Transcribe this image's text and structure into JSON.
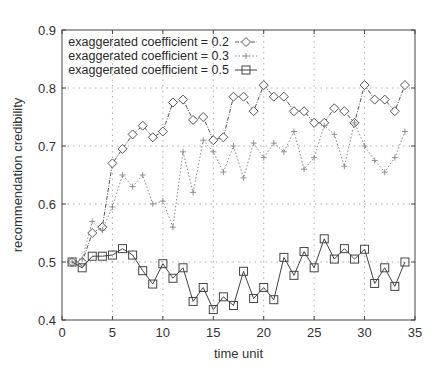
{
  "chart_data": {
    "type": "line",
    "title": "",
    "xlabel": "time unit",
    "ylabel": "recommendation credibility",
    "xlim": [
      0,
      35
    ],
    "ylim": [
      0.4,
      0.9
    ],
    "xticks": [
      0,
      5,
      10,
      15,
      20,
      25,
      30,
      35
    ],
    "yticks": [
      0.4,
      0.5,
      0.6,
      0.7,
      0.8,
      0.9
    ],
    "ytick_labels": [
      "0.4",
      "0.5",
      "0.6",
      "0.7",
      "0.8",
      "0.9"
    ],
    "grid": true,
    "legend_position": "upper left",
    "x": [
      1,
      2,
      3,
      4,
      5,
      6,
      7,
      8,
      9,
      10,
      11,
      12,
      13,
      14,
      15,
      16,
      17,
      18,
      19,
      20,
      21,
      22,
      23,
      24,
      25,
      26,
      27,
      28,
      29,
      30,
      31,
      32,
      33,
      34
    ],
    "series": [
      {
        "name": "exaggerated coefficient = 0.2",
        "marker": "diamond",
        "line": "dash-dot",
        "values": [
          0.5,
          0.5,
          0.55,
          0.56,
          0.67,
          0.695,
          0.72,
          0.735,
          0.715,
          0.725,
          0.775,
          0.78,
          0.745,
          0.75,
          0.71,
          0.715,
          0.785,
          0.785,
          0.76,
          0.805,
          0.785,
          0.785,
          0.76,
          0.76,
          0.74,
          0.74,
          0.765,
          0.76,
          0.74,
          0.805,
          0.78,
          0.78,
          0.76,
          0.805
        ]
      },
      {
        "name": "exaggerated coefficient = 0.3",
        "marker": "plus",
        "line": "dotted",
        "values": [
          0.5,
          0.505,
          0.57,
          0.555,
          0.595,
          0.65,
          0.63,
          0.65,
          0.6,
          0.605,
          0.56,
          0.69,
          0.62,
          0.71,
          0.69,
          0.655,
          0.7,
          0.645,
          0.705,
          0.68,
          0.705,
          0.69,
          0.725,
          0.66,
          0.68,
          0.735,
          0.72,
          0.665,
          0.74,
          0.7,
          0.675,
          0.655,
          0.68,
          0.725
        ]
      },
      {
        "name": "exaggerated coefficient = 0.5",
        "marker": "square",
        "line": "solid",
        "values": [
          0.5,
          0.49,
          0.51,
          0.51,
          0.512,
          0.523,
          0.512,
          0.485,
          0.462,
          0.497,
          0.472,
          0.49,
          0.432,
          0.456,
          0.418,
          0.44,
          0.425,
          0.484,
          0.437,
          0.456,
          0.435,
          0.508,
          0.477,
          0.518,
          0.49,
          0.54,
          0.505,
          0.523,
          0.505,
          0.522,
          0.463,
          0.49,
          0.458,
          0.5
        ]
      }
    ]
  },
  "colors": {
    "axis": "#444444",
    "grid": "#9a9a9a",
    "series": [
      "#555555",
      "#888888",
      "#444444"
    ]
  }
}
